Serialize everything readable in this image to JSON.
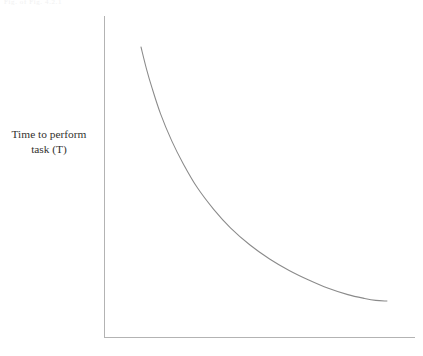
{
  "figure": {
    "background_color": "#ffffff",
    "scan_artifact_text": "Fig.  of Fig. 4.2.1"
  },
  "chart_data": {
    "type": "line",
    "title": "",
    "subtitle": "",
    "xlabel": "",
    "ylabel": "Time to perform task (T)",
    "ylabel_lines": [
      "Time to perform",
      "task (T)"
    ],
    "legend": [],
    "legend_position": "none",
    "grid": false,
    "axis_ticks": false,
    "tick_labels_x": [],
    "tick_labels_y": [],
    "xlim": [
      0,
      1
    ],
    "ylim": [
      0,
      1
    ],
    "annotations": [],
    "series": [
      {
        "name": "Time to perform task",
        "color": "#8a8a8a",
        "shape": "decaying-exponential",
        "x": [
          0.12,
          0.14,
          0.16,
          0.19,
          0.23,
          0.27,
          0.32,
          0.38,
          0.44,
          0.51,
          0.58,
          0.65,
          0.72,
          0.79,
          0.86,
          0.92,
          0.96,
          1.0
        ],
        "y": [
          0.91,
          0.84,
          0.78,
          0.7,
          0.615,
          0.545,
          0.47,
          0.4,
          0.342,
          0.288,
          0.244,
          0.208,
          0.178,
          0.152,
          0.132,
          0.12,
          0.114,
          0.112
        ]
      }
    ],
    "axes_color": "#b3b3b3",
    "curve_color": "#8a8a8a",
    "pixel_geometry": {
      "y_axis_x": 104,
      "y_axis_top": 16,
      "x_axis_y": 337,
      "x_axis_right": 415,
      "curve_start": [
        141,
        47
      ],
      "curve_end": [
        387,
        301
      ]
    }
  }
}
